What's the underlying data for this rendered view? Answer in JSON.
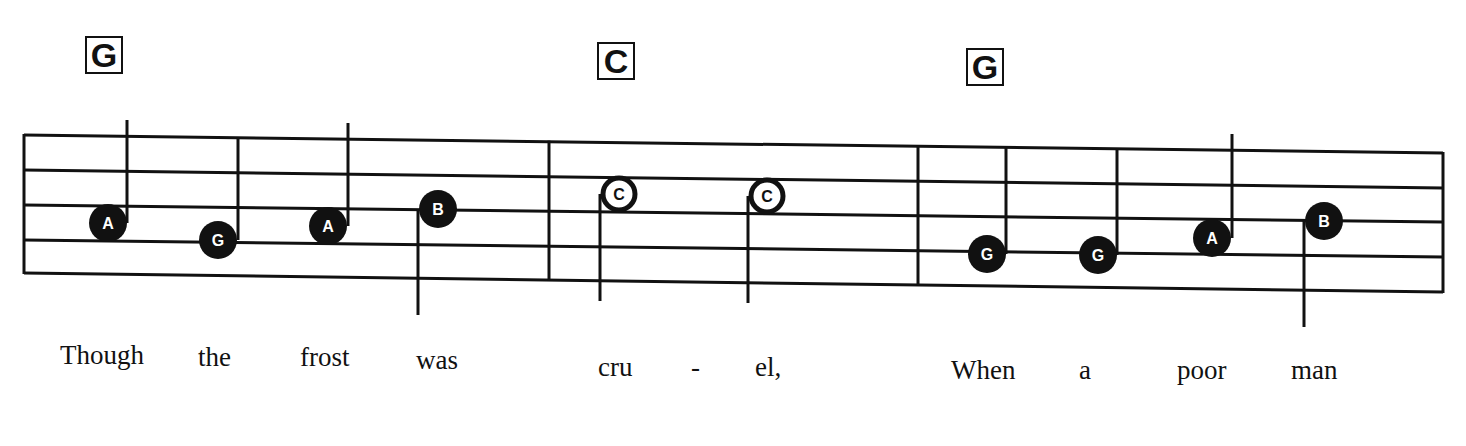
{
  "staff": {
    "lines": 5,
    "left_x": 24,
    "right_x": 1443,
    "left_line_y": [
      135,
      170,
      205,
      240,
      273
    ],
    "right_line_y": [
      153,
      188,
      222,
      257,
      292
    ],
    "barlines_x": [
      24,
      549,
      918,
      1443
    ],
    "color": "#111111"
  },
  "chords": [
    {
      "label": "G",
      "x": 85,
      "y": 36
    },
    {
      "label": "C",
      "x": 597,
      "y": 42
    },
    {
      "label": "G",
      "x": 966,
      "y": 48
    }
  ],
  "notes": [
    {
      "label": "A",
      "x": 108,
      "y": 223,
      "style": "filled",
      "stem": "up",
      "stem_x": 127,
      "stem_end": 120
    },
    {
      "label": "G",
      "x": 218,
      "y": 240,
      "style": "filled",
      "stem": "up",
      "stem_x": 238,
      "stem_end": 138
    },
    {
      "label": "A",
      "x": 328,
      "y": 226,
      "style": "filled",
      "stem": "up",
      "stem_x": 348,
      "stem_end": 123
    },
    {
      "label": "B",
      "x": 438,
      "y": 209,
      "style": "filled",
      "stem": "down",
      "stem_x": 418,
      "stem_end": 315
    },
    {
      "label": "C",
      "x": 619,
      "y": 194,
      "style": "outline",
      "stem": "down",
      "stem_x": 600,
      "stem_end": 301
    },
    {
      "label": "C",
      "x": 767,
      "y": 196,
      "style": "outline",
      "stem": "down",
      "stem_x": 748,
      "stem_end": 303
    },
    {
      "label": "G",
      "x": 987,
      "y": 254,
      "style": "filled",
      "stem": "up",
      "stem_x": 1006,
      "stem_end": 148
    },
    {
      "label": "G",
      "x": 1098,
      "y": 255,
      "style": "filled",
      "stem": "up",
      "stem_x": 1117,
      "stem_end": 150
    },
    {
      "label": "A",
      "x": 1212,
      "y": 238,
      "style": "filled",
      "stem": "up",
      "stem_x": 1232,
      "stem_end": 134
    },
    {
      "label": "B",
      "x": 1324,
      "y": 221,
      "style": "filled",
      "stem": "down",
      "stem_x": 1304,
      "stem_end": 327
    }
  ],
  "lyrics": [
    {
      "text": "Though",
      "x": 60,
      "y": 340
    },
    {
      "text": "the",
      "x": 198,
      "y": 342
    },
    {
      "text": "frost",
      "x": 300,
      "y": 342
    },
    {
      "text": "was",
      "x": 416,
      "y": 345
    },
    {
      "text": "cru",
      "x": 598,
      "y": 352
    },
    {
      "text": "-",
      "x": 691,
      "y": 352
    },
    {
      "text": "el,",
      "x": 755,
      "y": 352
    },
    {
      "text": "When",
      "x": 951,
      "y": 355
    },
    {
      "text": "a",
      "x": 1079,
      "y": 355
    },
    {
      "text": "poor",
      "x": 1177,
      "y": 355
    },
    {
      "text": "man",
      "x": 1291,
      "y": 355
    }
  ]
}
